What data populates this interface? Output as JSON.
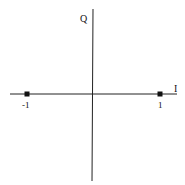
{
  "diagram": {
    "type": "constellation",
    "title": "",
    "axes": {
      "horizontal_label": "I",
      "vertical_label": "Q"
    },
    "points": [
      {
        "label": "-1",
        "i": -1,
        "q": 0
      },
      {
        "label": "1",
        "i": 1,
        "q": 0
      }
    ],
    "colors": {
      "axis": "#222222",
      "point": "#111111",
      "background": "#ffffff"
    }
  }
}
